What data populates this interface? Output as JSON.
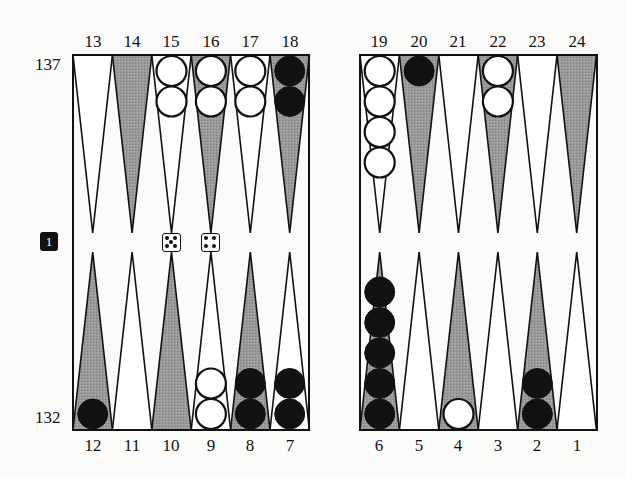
{
  "colors": {
    "background": "#fbfbfa",
    "dark_point": "#8e8e8e",
    "light_point": "#ffffff",
    "black_checker": "#111111",
    "white_checker": "#ffffff",
    "line": "#111111"
  },
  "pip_counts": {
    "top_player": "137",
    "bottom_player": "132"
  },
  "cube": {
    "value": "1"
  },
  "dice": [
    5,
    4
  ],
  "top_labels": [
    "13",
    "14",
    "15",
    "16",
    "17",
    "18",
    "19",
    "20",
    "21",
    "22",
    "23",
    "24"
  ],
  "bottom_labels": [
    "12",
    "11",
    "10",
    "9",
    "8",
    "7",
    "6",
    "5",
    "4",
    "3",
    "2",
    "1"
  ],
  "points": [
    {
      "point": 1,
      "shade": "light",
      "checkers": 0,
      "color": null
    },
    {
      "point": 2,
      "shade": "dark",
      "checkers": 2,
      "color": "black"
    },
    {
      "point": 3,
      "shade": "light",
      "checkers": 0,
      "color": null
    },
    {
      "point": 4,
      "shade": "dark",
      "checkers": 1,
      "color": "white"
    },
    {
      "point": 5,
      "shade": "light",
      "checkers": 0,
      "color": null
    },
    {
      "point": 6,
      "shade": "dark",
      "checkers": 5,
      "color": "black"
    },
    {
      "point": 7,
      "shade": "light",
      "checkers": 2,
      "color": "black"
    },
    {
      "point": 8,
      "shade": "dark",
      "checkers": 2,
      "color": "black"
    },
    {
      "point": 9,
      "shade": "light",
      "checkers": 2,
      "color": "white"
    },
    {
      "point": 10,
      "shade": "dark",
      "checkers": 0,
      "color": null
    },
    {
      "point": 11,
      "shade": "light",
      "checkers": 0,
      "color": null
    },
    {
      "point": 12,
      "shade": "dark",
      "checkers": 1,
      "color": "black"
    },
    {
      "point": 13,
      "shade": "light",
      "checkers": 0,
      "color": null
    },
    {
      "point": 14,
      "shade": "dark",
      "checkers": 0,
      "color": null
    },
    {
      "point": 15,
      "shade": "light",
      "checkers": 2,
      "color": "white"
    },
    {
      "point": 16,
      "shade": "dark",
      "checkers": 2,
      "color": "white"
    },
    {
      "point": 17,
      "shade": "light",
      "checkers": 2,
      "color": "white"
    },
    {
      "point": 18,
      "shade": "dark",
      "checkers": 2,
      "color": "black"
    },
    {
      "point": 19,
      "shade": "light",
      "checkers": 4,
      "color": "white"
    },
    {
      "point": 20,
      "shade": "dark",
      "checkers": 1,
      "color": "black"
    },
    {
      "point": 21,
      "shade": "light",
      "checkers": 0,
      "color": null
    },
    {
      "point": 22,
      "shade": "dark",
      "checkers": 2,
      "color": "white"
    },
    {
      "point": 23,
      "shade": "light",
      "checkers": 0,
      "color": null
    },
    {
      "point": 24,
      "shade": "dark",
      "checkers": 0,
      "color": null
    }
  ]
}
